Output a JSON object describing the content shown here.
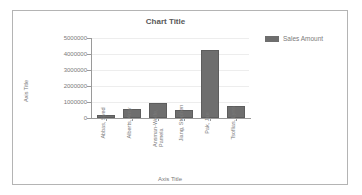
{
  "chart_data": {
    "type": "bar",
    "title": "Chart Title",
    "xlabel": "Axis Title",
    "ylabel": "Axis Title",
    "categories": [
      "Abbas, Syed",
      "Alberts, Amy",
      "Ansman-Wolfe, Pamela",
      "Jiang, Stephen",
      "Pak, Jae",
      "Tsoflias, Lynn"
    ],
    "series": [
      {
        "name": "Sales Amount",
        "values": [
          172000,
          570000,
          950000,
          510000,
          4250000,
          780000
        ]
      }
    ],
    "ylim": [
      0,
      5000000
    ],
    "yticks": [
      0,
      1000000,
      2000000,
      3000000,
      4000000,
      5000000
    ],
    "ytick_labels": [
      "0",
      "1000000",
      "2000000",
      "3000000",
      "4000000",
      "5000000"
    ],
    "grid": true,
    "legend_position": "right",
    "bar_color": "#6e6e6e",
    "grid_color": "#ededed",
    "axis_color": "#9a9a9a",
    "text_color": "#7a7a7a",
    "title_color": "#595959"
  },
  "legend": {
    "entries": [
      {
        "label": "Sales Amount",
        "color": "#6e6e6e"
      }
    ]
  }
}
